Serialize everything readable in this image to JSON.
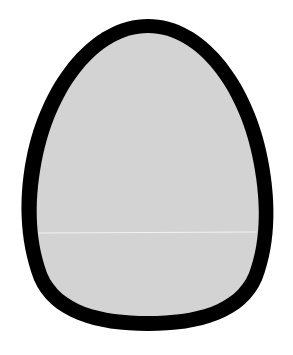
{
  "figure": {
    "colors": {
      "background": "#ffffff",
      "outline": "#000000",
      "fill": "#d3d3d3",
      "highlight_line": "#f2f2f2"
    }
  }
}
